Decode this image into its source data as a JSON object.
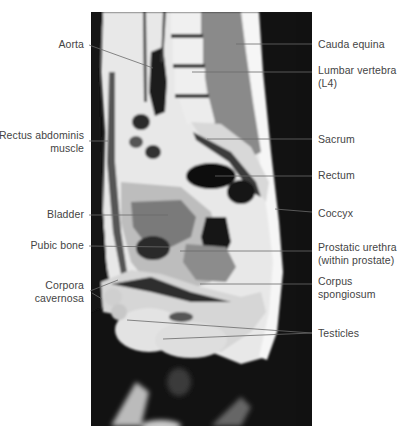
{
  "figure": {
    "type": "Sagittal MRI of the male pelvis",
    "colors": {
      "background": "#ffffff",
      "label_text": "#444444",
      "leader_line": "#6a6a6a",
      "scan_black": "#111111"
    }
  },
  "labels_left": [
    {
      "id": "aorta",
      "text": "Aorta"
    },
    {
      "id": "rectus",
      "line1": "Rectus abdominis",
      "line2": "muscle"
    },
    {
      "id": "bladder",
      "text": "Bladder"
    },
    {
      "id": "pubic",
      "text": "Pubic bone"
    },
    {
      "id": "corpora",
      "line1": "Corpora",
      "line2": "cavernosa"
    }
  ],
  "labels_right": [
    {
      "id": "cauda",
      "text": "Cauda equina"
    },
    {
      "id": "lumbar",
      "line1": "Lumbar vertebra",
      "line2": "(L4)"
    },
    {
      "id": "sacrum",
      "text": "Sacrum"
    },
    {
      "id": "rectum",
      "text": "Rectum"
    },
    {
      "id": "coccyx",
      "text": "Coccyx"
    },
    {
      "id": "prostatic",
      "line1": "Prostatic urethra",
      "line2": "(within prostate)"
    },
    {
      "id": "spongiosum",
      "line1": "Corpus",
      "line2": "spongiosum"
    },
    {
      "id": "testicles",
      "text": "Testicles"
    }
  ]
}
